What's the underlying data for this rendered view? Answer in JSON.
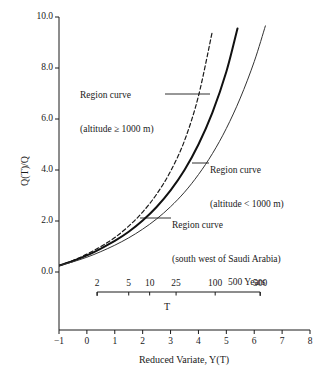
{
  "figure": {
    "y_axis_title": "Q(T)/Q",
    "x_axis_title": "Reduced Variate, Y(T)",
    "secondary_axis_title": "T",
    "secondary_axis_unit": "500 Years"
  },
  "y_ticks": [
    {
      "value": 10.0,
      "label": "10.0"
    },
    {
      "value": 8.0,
      "label": "8.0"
    },
    {
      "value": 6.0,
      "label": "6.0"
    },
    {
      "value": 4.0,
      "label": "4.0"
    },
    {
      "value": 2.0,
      "label": "2.0"
    },
    {
      "value": 0.0,
      "label": "0.0"
    }
  ],
  "x_ticks": [
    {
      "value": -1,
      "label": "−1"
    },
    {
      "value": 0,
      "label": "0"
    },
    {
      "value": 1,
      "label": "1"
    },
    {
      "value": 2,
      "label": "2"
    },
    {
      "value": 3,
      "label": "3"
    },
    {
      "value": 4,
      "label": "4"
    },
    {
      "value": 5,
      "label": "5"
    },
    {
      "value": 6,
      "label": "6"
    },
    {
      "value": 7,
      "label": "7"
    },
    {
      "value": 8,
      "label": "8"
    }
  ],
  "t_ticks": [
    {
      "T": 2,
      "label": "2",
      "y": 0.3665
    },
    {
      "T": 5,
      "label": "5",
      "y": 1.4999
    },
    {
      "T": 10,
      "label": "10",
      "y": 2.2504
    },
    {
      "T": 25,
      "label": "25",
      "y": 3.1985
    },
    {
      "T": 100,
      "label": "100",
      "y": 4.6001
    },
    {
      "T": 500,
      "label": "500",
      "y": 6.2136
    }
  ],
  "annotations": [
    {
      "id": "annotation-altitude-ge-1000",
      "line1": "Region curve",
      "line2": "(altitude ≥ 1000 m)",
      "target_series": "altitude_ge_1000"
    },
    {
      "id": "annotation-altitude-lt-1000",
      "line1": "Region curve",
      "line2": "(altitude < 1000 m)",
      "target_series": "altitude_lt_1000"
    },
    {
      "id": "annotation-south-west-saudi-arabia",
      "line1": "Region curve",
      "line2": "(south west of Saudi Arabia)",
      "target_series": "south_west_saudi_arabia"
    }
  ],
  "chart_data": {
    "type": "line",
    "title": "",
    "xlabel": "Reduced Variate, Y(T)",
    "ylabel": "Q(T)/Q",
    "xlim": [
      -1,
      8
    ],
    "ylim": [
      0.0,
      10.0
    ],
    "grid": false,
    "legend": "inline-annotations",
    "secondary_xaxis": {
      "label": "T",
      "unit_suffix": "Years",
      "tick_values": [
        2,
        5,
        10,
        25,
        100,
        500
      ],
      "tick_labels": [
        "2",
        "5",
        "10",
        "25",
        "100",
        "500"
      ],
      "mapping": "Y(T) = -ln(-ln(1 - 1/T))"
    },
    "series": [
      {
        "name": "Region curve (altitude ≥ 1000 m)",
        "key": "altitude_ge_1000",
        "style": "dashed",
        "color": "#1a1a1a",
        "x": [
          -1.0,
          -0.5,
          0.0,
          0.5,
          1.0,
          1.5,
          2.0,
          2.5,
          3.0,
          3.5,
          4.0,
          4.5
        ],
        "y": [
          0.25,
          0.45,
          0.7,
          1.0,
          1.35,
          1.8,
          2.35,
          3.05,
          3.95,
          5.15,
          6.9,
          9.45
        ]
      },
      {
        "name": "Region curve (altitude < 1000 m)",
        "key": "altitude_lt_1000",
        "style": "solid-thick",
        "color": "#111111",
        "x": [
          -1.0,
          -0.5,
          0.0,
          0.5,
          1.0,
          1.5,
          2.0,
          2.5,
          3.0,
          3.5,
          4.0,
          4.5,
          5.0,
          5.4
        ],
        "y": [
          0.25,
          0.43,
          0.65,
          0.92,
          1.22,
          1.58,
          2.02,
          2.55,
          3.2,
          4.0,
          5.0,
          6.25,
          7.85,
          9.55
        ]
      },
      {
        "name": "Region curve (south west of Saudi Arabia)",
        "key": "south_west_saudi_arabia",
        "style": "solid-thin",
        "color": "#333333",
        "x": [
          -1.0,
          -0.5,
          0.0,
          0.5,
          1.0,
          1.5,
          2.0,
          2.5,
          3.0,
          3.5,
          4.0,
          4.5,
          5.0,
          5.5,
          6.0,
          6.4
        ],
        "y": [
          0.25,
          0.4,
          0.58,
          0.8,
          1.05,
          1.34,
          1.68,
          2.08,
          2.56,
          3.13,
          3.82,
          4.64,
          5.63,
          6.82,
          8.25,
          9.65
        ]
      }
    ]
  }
}
